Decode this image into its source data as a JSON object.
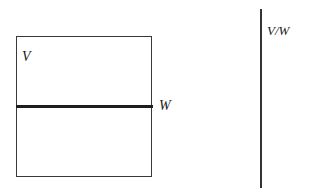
{
  "diagram": {
    "left_figure": {
      "shape": "rectangle",
      "upper_region_label": "V",
      "divider_label": "W"
    },
    "right_figure": {
      "shape": "vertical-line",
      "label": "V/W"
    }
  },
  "colors": {
    "stroke": "#3a3a3a",
    "divider": "#1e1e1e",
    "text": "#1a1a1a",
    "background": "#ffffff"
  }
}
